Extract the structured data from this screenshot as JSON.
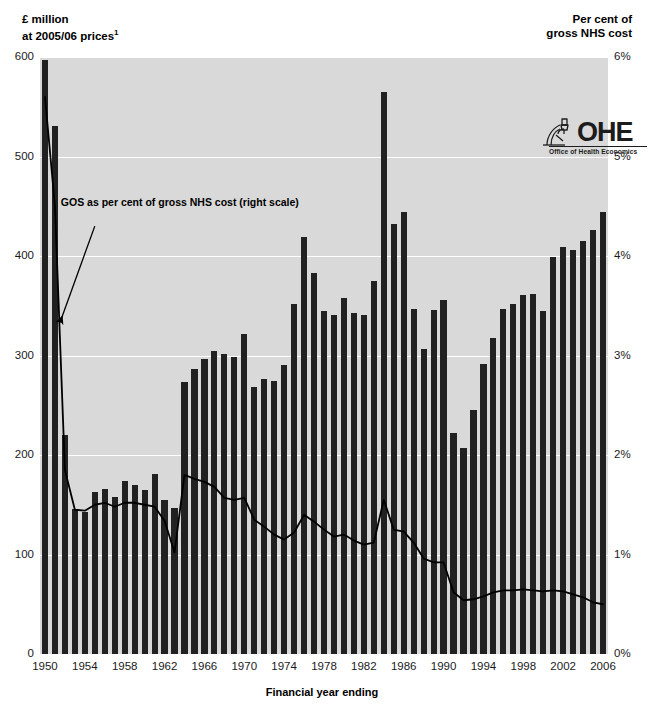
{
  "figure": {
    "caption_partial": "",
    "left_axis_title_line1": "£ million",
    "left_axis_title_line2": "at 2005/06 prices",
    "left_axis_title_superscript": "1",
    "right_axis_title_line1": "Per cent of",
    "right_axis_title_line2": "gross NHS cost"
  },
  "logo": {
    "name": "OHE",
    "subtitle": "Office of Health Economics",
    "icon": "microscope-icon"
  },
  "chart_data": {
    "type": "bar",
    "title": "",
    "subtitle": "",
    "xlabel": "Financial year ending",
    "ylabel": "£ million at 2005/06 prices",
    "y2label": "Per cent of gross NHS cost",
    "ylim": [
      0,
      600
    ],
    "y2lim": [
      0,
      6
    ],
    "grid": true,
    "grid_axis": "y",
    "legend": false,
    "annotations": [
      {
        "text": "GOS as per cent of gross NHS cost (right scale)",
        "x": 1955,
        "y": 430,
        "arrow_to_x": 1951.5,
        "arrow_to_y": 333
      }
    ],
    "yticks": [
      0,
      100,
      200,
      300,
      400,
      500,
      600
    ],
    "ytick_labels": [
      "0",
      "100",
      "200",
      "300",
      "400",
      "500",
      "600"
    ],
    "y2ticks": [
      0,
      1,
      2,
      3,
      4,
      5,
      6
    ],
    "y2tick_labels": [
      "0%",
      "1%",
      "2%",
      "3%",
      "4%",
      "5%",
      "6%"
    ],
    "xticks": [
      1950,
      1954,
      1958,
      1962,
      1966,
      1970,
      1974,
      1978,
      1982,
      1986,
      1990,
      1994,
      1998,
      2002,
      2006
    ],
    "categories": [
      1950,
      1951,
      1952,
      1953,
      1954,
      1955,
      1956,
      1957,
      1958,
      1959,
      1960,
      1961,
      1962,
      1963,
      1964,
      1965,
      1966,
      1967,
      1968,
      1969,
      1970,
      1971,
      1972,
      1973,
      1974,
      1975,
      1976,
      1977,
      1978,
      1979,
      1980,
      1981,
      1982,
      1983,
      1984,
      1985,
      1986,
      1987,
      1988,
      1989,
      1990,
      1991,
      1992,
      1993,
      1994,
      1995,
      1996,
      1997,
      1998,
      1999,
      2000,
      2001,
      2002,
      2003,
      2004,
      2005,
      2006
    ],
    "series": [
      {
        "name": "GOS expenditure (£ million at 2005/06 prices)",
        "type": "bar",
        "axis": "left",
        "color": "#212121",
        "values": [
          597,
          531,
          220,
          146,
          143,
          163,
          166,
          158,
          174,
          170,
          165,
          181,
          155,
          147,
          273,
          286,
          297,
          305,
          302,
          299,
          322,
          268,
          276,
          274,
          290,
          352,
          419,
          383,
          345,
          341,
          358,
          343,
          341,
          375,
          565,
          432,
          444,
          347,
          307,
          346,
          356,
          222,
          207,
          245,
          291,
          318,
          347,
          352,
          361,
          362,
          345,
          399,
          409,
          406,
          415,
          426,
          444
        ]
      },
      {
        "name": "GOS as per cent of gross NHS cost",
        "type": "line",
        "axis": "right",
        "color": "#000000",
        "values": [
          5.6,
          4.5,
          1.85,
          1.45,
          1.44,
          1.5,
          1.52,
          1.48,
          1.52,
          1.52,
          1.5,
          1.48,
          1.34,
          1.02,
          1.8,
          1.76,
          1.73,
          1.68,
          1.57,
          1.55,
          1.57,
          1.35,
          1.28,
          1.2,
          1.15,
          1.22,
          1.4,
          1.33,
          1.25,
          1.18,
          1.2,
          1.14,
          1.1,
          1.12,
          1.55,
          1.25,
          1.23,
          1.12,
          0.96,
          0.92,
          0.92,
          0.62,
          0.54,
          0.55,
          0.58,
          0.62,
          0.64,
          0.64,
          0.65,
          0.64,
          0.63,
          0.64,
          0.63,
          0.6,
          0.57,
          0.52,
          0.5
        ]
      }
    ]
  }
}
